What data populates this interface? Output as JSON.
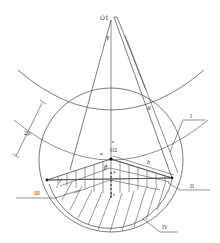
{
  "diagram": {
    "type": "geometric-diagram",
    "points": {
      "o1": "O1",
      "o2": "O2"
    },
    "symbols": {
      "gamma": "γ",
      "beta": "β",
      "alpha": "α",
      "R": "R",
      "h": "h",
      "two_p": "2p",
      "s": "s",
      "y": "y",
      "z": "z"
    },
    "regions": {
      "I": "I",
      "II": "II",
      "III": "III",
      "IV": "IV"
    },
    "colors": {
      "line": "#333333",
      "background": "#ffffff"
    }
  }
}
